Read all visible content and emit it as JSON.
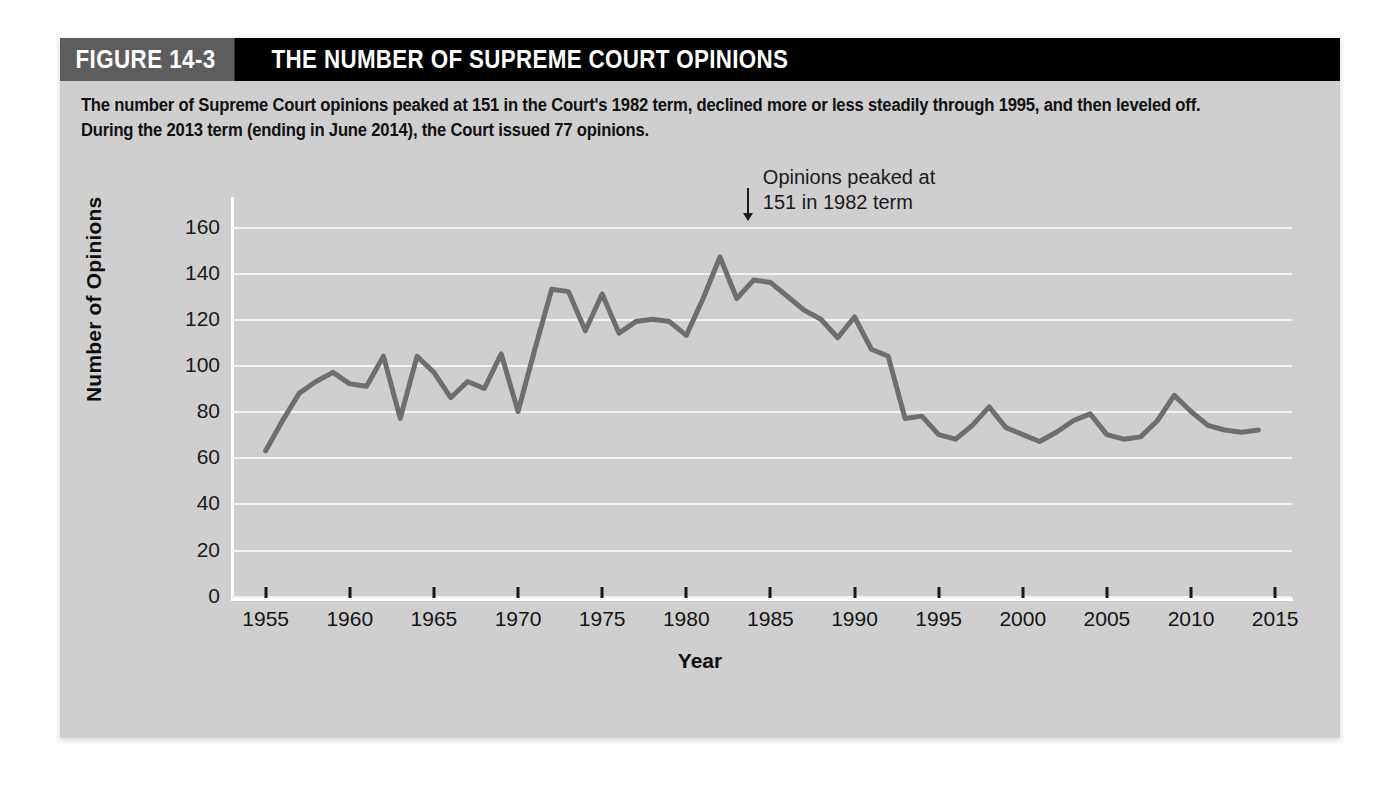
{
  "figure": {
    "number_label": "FIGURE 14-3",
    "title": "THE NUMBER OF SUPREME COURT OPINIONS",
    "caption": "The number of Supreme Court opinions peaked at 151 in the Court's 1982 term, declined more or less steadily through 1995, and then leveled off. During the 2013 term (ending in June 2014), the Court issued 77 opinions."
  },
  "colors": {
    "panel_background": "#cfcfcf",
    "header_black": "#000000",
    "header_gray": "#5d5d5d",
    "gridline": "#f2f2f2",
    "series_line": "#6e6e6e",
    "axis_white": "#ffffff",
    "text": "#141414"
  },
  "chart_data": {
    "type": "line",
    "title": "THE NUMBER OF SUPREME COURT OPINIONS",
    "xlabel": "Year",
    "ylabel": "Number of Opinions",
    "xlim": [
      1953,
      2016
    ],
    "ylim": [
      0,
      170
    ],
    "grid": true,
    "legend": "none",
    "y_ticks": [
      0,
      20,
      40,
      60,
      80,
      100,
      120,
      140,
      160
    ],
    "x_ticks": [
      1955,
      1960,
      1965,
      1970,
      1975,
      1980,
      1985,
      1990,
      1995,
      2000,
      2005,
      2010,
      2015
    ],
    "annotations": [
      {
        "text_line1": "Opinions peaked at",
        "text_line2": "151 in 1982 term",
        "arrow": "down-arrow",
        "points_to_year": 1982,
        "points_to_value": 151
      }
    ],
    "series": [
      {
        "name": "Number of Opinions",
        "x": [
          1955,
          1956,
          1957,
          1958,
          1959,
          1960,
          1961,
          1962,
          1963,
          1964,
          1965,
          1966,
          1967,
          1968,
          1969,
          1970,
          1971,
          1972,
          1973,
          1974,
          1975,
          1976,
          1977,
          1978,
          1979,
          1980,
          1981,
          1982,
          1983,
          1984,
          1985,
          1986,
          1987,
          1988,
          1989,
          1990,
          1991,
          1992,
          1993,
          1994,
          1995,
          1996,
          1997,
          1998,
          1999,
          2000,
          2001,
          2002,
          2003,
          2004,
          2005,
          2006,
          2007,
          2008,
          2009,
          2010,
          2011,
          2012,
          2013,
          2014
        ],
        "values": [
          63,
          76,
          88,
          93,
          97,
          92,
          91,
          104,
          77,
          104,
          97,
          86,
          93,
          90,
          105,
          80,
          107,
          133,
          132,
          115,
          131,
          114,
          119,
          120,
          119,
          113,
          129,
          147,
          129,
          137,
          136,
          130,
          124,
          120,
          112,
          121,
          107,
          104,
          77,
          78,
          70,
          68,
          74,
          82,
          73,
          70,
          67,
          71,
          76,
          79,
          70,
          68,
          69,
          76,
          87,
          80,
          74,
          72,
          71,
          72
        ]
      }
    ]
  }
}
